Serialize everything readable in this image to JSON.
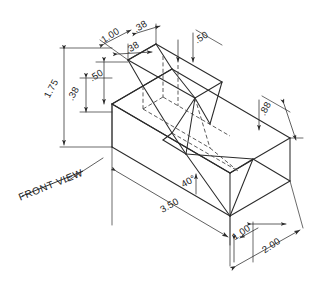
{
  "drawing": {
    "title_label": "FRONT VIEW",
    "projection": "isometric",
    "units": "inches",
    "line_color": "#2b2b2b",
    "hidden_line_color": "#4a4a4a",
    "background_color": "#ffffff",
    "dimensions": [
      {
        "id": "top-width-1",
        "label": "1.00",
        "rotation": -32,
        "x": 112,
        "y": 38
      },
      {
        "id": "top-notch-1",
        "label": ".38",
        "rotation": -32,
        "x": 142,
        "y": 29
      },
      {
        "id": "top-notch-2",
        "label": ".38",
        "rotation": -32,
        "x": 134,
        "y": 50
      },
      {
        "id": "top-depth",
        "label": ".50",
        "rotation": -32,
        "x": 203,
        "y": 40
      },
      {
        "id": "overall-height",
        "label": "1.75",
        "rotation": -62,
        "x": 54,
        "y": 90
      },
      {
        "id": "base-height",
        "label": ".38",
        "rotation": -62,
        "x": 76,
        "y": 95
      },
      {
        "id": "step-height",
        "label": ".50",
        "rotation": -32,
        "x": 98,
        "y": 78
      },
      {
        "id": "right-height",
        "label": ".88",
        "rotation": -62,
        "x": 268,
        "y": 110
      },
      {
        "id": "bevel-angle",
        "label": "40°",
        "rotation": -30,
        "x": 190,
        "y": 184
      },
      {
        "id": "overall-length",
        "label": "3.50",
        "rotation": -30,
        "x": 171,
        "y": 208
      },
      {
        "id": "bevel-run",
        "label": "1.00",
        "rotation": -34,
        "x": 243,
        "y": 235
      },
      {
        "id": "overall-width",
        "label": "2.00",
        "rotation": -34,
        "x": 273,
        "y": 248
      }
    ]
  }
}
